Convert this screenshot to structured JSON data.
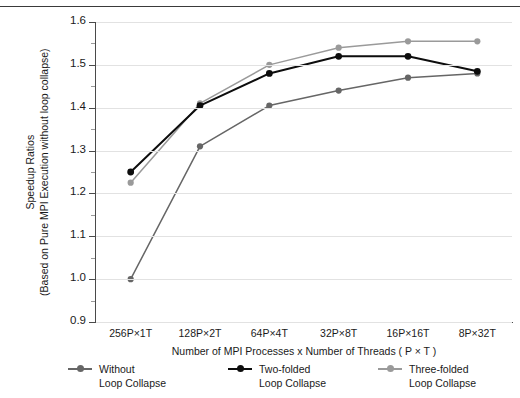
{
  "chart_data": {
    "type": "line",
    "title": "",
    "xlabel": "Number of MPI Processes x Number of Threads ( P × T )",
    "ylabel_line1": "Speedup Ratios",
    "ylabel_line2": "(Based on Pure MPI Execution without loop collapse)",
    "categories": [
      "256P×1T",
      "128P×2T",
      "64P×4T",
      "32P×8T",
      "16P×16T",
      "8P×32T"
    ],
    "ylim": [
      0.9,
      1.6
    ],
    "ytick_labels": [
      "1.6",
      "1.5",
      "1.4",
      "1.3",
      "1.2",
      "1.1",
      "1.0",
      "0.9"
    ],
    "ytick_values": [
      1.6,
      1.5,
      1.4,
      1.3,
      1.2,
      1.1,
      1.0,
      0.9
    ],
    "grid": true,
    "legend_position": "bottom",
    "series": [
      {
        "name": "Without Loop Collapse",
        "name_line1": "Without",
        "name_line2": "Loop Collapse",
        "color": "#666666",
        "values": [
          1.0,
          1.31,
          1.405,
          1.44,
          1.47,
          1.48
        ]
      },
      {
        "name": "Two-folded Loop Collapse",
        "name_line1": "Two-folded",
        "name_line2": "Loop Collapse",
        "color": "#0d0d0d",
        "values": [
          1.25,
          1.405,
          1.48,
          1.52,
          1.52,
          1.485
        ]
      },
      {
        "name": "Three-folded Loop Collapse",
        "name_line1": "Three-folded",
        "name_line2": "Loop Collapse",
        "color": "#9a9a9a",
        "values": [
          1.225,
          1.41,
          1.5,
          1.54,
          1.555,
          1.555
        ]
      }
    ]
  }
}
